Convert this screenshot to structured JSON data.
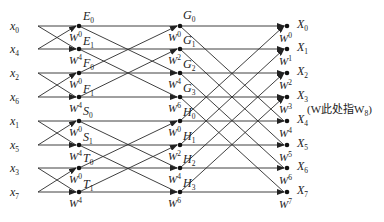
{
  "diagram": {
    "annotation": "(W此处指W",
    "annotation_sub": "8",
    "annotation_close": ")",
    "inputs": [
      {
        "base": "x",
        "sub": "0"
      },
      {
        "base": "x",
        "sub": "4"
      },
      {
        "base": "x",
        "sub": "2"
      },
      {
        "base": "x",
        "sub": "6"
      },
      {
        "base": "x",
        "sub": "1"
      },
      {
        "base": "x",
        "sub": "5"
      },
      {
        "base": "x",
        "sub": "3"
      },
      {
        "base": "x",
        "sub": "7"
      }
    ],
    "stage1": {
      "nodes": [
        {
          "base": "E",
          "sub": "0"
        },
        {
          "base": "E",
          "sub": "1"
        },
        {
          "base": "F",
          "sub": "0"
        },
        {
          "base": "F",
          "sub": "1"
        },
        {
          "base": "S",
          "sub": "0"
        },
        {
          "base": "S",
          "sub": "1"
        },
        {
          "base": "T",
          "sub": "0"
        },
        {
          "base": "T",
          "sub": "1"
        }
      ],
      "twiddles": [
        "0",
        "4",
        "0",
        "4",
        "0",
        "4",
        "0",
        "4"
      ]
    },
    "stage2": {
      "nodes": [
        {
          "base": "G",
          "sub": "0"
        },
        {
          "base": "G",
          "sub": "1"
        },
        {
          "base": "G",
          "sub": "2"
        },
        {
          "base": "G",
          "sub": "3"
        },
        {
          "base": "H",
          "sub": "0"
        },
        {
          "base": "H",
          "sub": "1"
        },
        {
          "base": "H",
          "sub": "2"
        },
        {
          "base": "H",
          "sub": "3"
        }
      ],
      "twiddles": [
        "0",
        "2",
        "4",
        "6",
        "0",
        "2",
        "4",
        "6"
      ]
    },
    "outputs": {
      "nodes": [
        {
          "base": "X",
          "sub": "0"
        },
        {
          "base": "X",
          "sub": "1"
        },
        {
          "base": "X",
          "sub": "2"
        },
        {
          "base": "X",
          "sub": "3"
        },
        {
          "base": "X",
          "sub": "4"
        },
        {
          "base": "X",
          "sub": "5"
        },
        {
          "base": "X",
          "sub": "6"
        },
        {
          "base": "X",
          "sub": "7"
        }
      ],
      "twiddles": [
        "0",
        "1",
        "2",
        "3",
        "4",
        "5",
        "6",
        "7"
      ]
    },
    "twiddle_base": "W"
  }
}
